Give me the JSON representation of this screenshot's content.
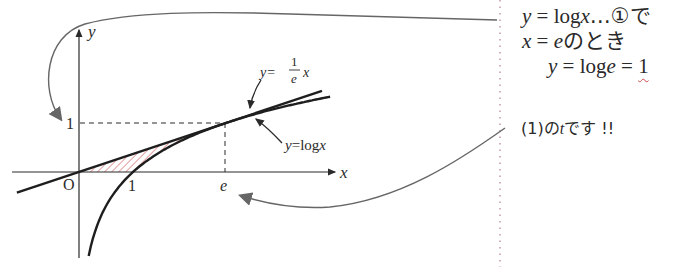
{
  "figure": {
    "axes": {
      "x_label": "x",
      "y_label": "y",
      "origin_label": "O",
      "x_ticks": [
        "1",
        "e"
      ],
      "y_ticks": [
        "1"
      ]
    },
    "curves": [
      {
        "name": "log-curve",
        "label_prefix": "y=log",
        "label_var": "x",
        "equation": "y = log x"
      },
      {
        "name": "tangent-line",
        "label_prefix": "y=",
        "frac_num": "1",
        "frac_den": "e",
        "label_var": "x",
        "equation": "y = (1/e) x"
      }
    ],
    "tangent_point": {
      "x": "e",
      "y": "1"
    },
    "shaded_region": "area between y=(1/e)x, y=log x and the x-axis",
    "colors": {
      "ink": "#2a2a2a",
      "arrow": "#555555",
      "hatch": "#d05a5a",
      "divider": "#c8a0a8",
      "wavy": "#d04a4a"
    }
  },
  "notes": {
    "line1": {
      "y": "y",
      "eq": " = log",
      "x": "x",
      "rest": "…①で"
    },
    "line2": {
      "x": "x",
      "eq": " = ",
      "e": "e",
      "rest": "のとき"
    },
    "line3": {
      "y": "y",
      "eq": " = log",
      "e": "e",
      "eq2": " = ",
      "one": "1"
    },
    "line4": {
      "pre": "(1)の",
      "t": "t",
      "post": "です !!"
    }
  }
}
